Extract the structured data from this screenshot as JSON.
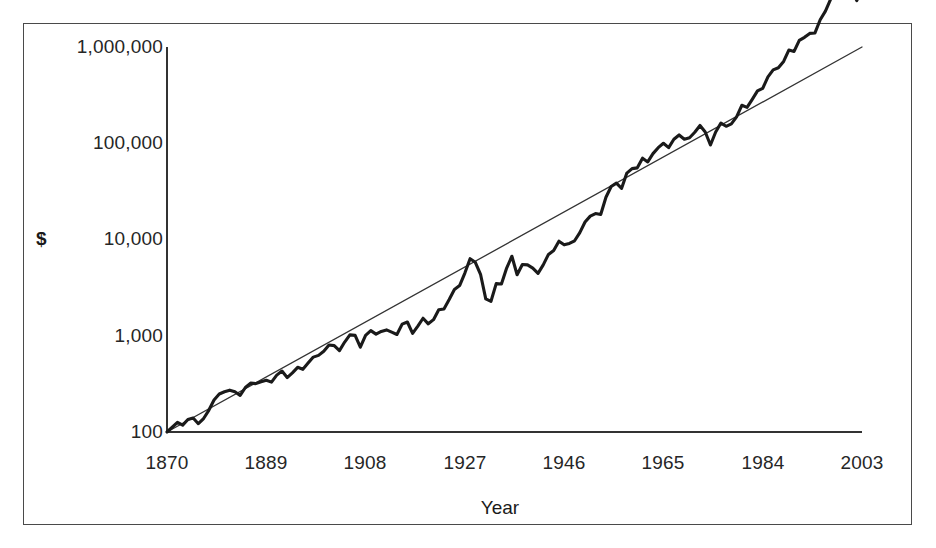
{
  "figure": {
    "background": "#ffffff",
    "frame_color": "#4a4a4a",
    "series_color": "#1a1a1a",
    "trend_color": "#333333"
  },
  "axis": {
    "y_label": "$",
    "x_label": "Year",
    "y_ticks": [
      "1,000,000",
      "100,000",
      "10,000",
      "1,000",
      "100"
    ],
    "x_ticks": [
      "1870",
      "1889",
      "1908",
      "1927",
      "1946",
      "1965",
      "1984",
      "2003"
    ]
  },
  "chart_data": {
    "type": "line",
    "title": "",
    "xlabel": "Year",
    "ylabel": "$",
    "yscale": "log",
    "ylim": [
      100,
      1000000
    ],
    "xlim": [
      1870,
      2003
    ],
    "grid": false,
    "legend": null,
    "ytick_values": [
      1000000,
      100000,
      10000,
      1000,
      100
    ],
    "ytick_labels": [
      "1,000,000",
      "100,000",
      "10,000",
      "1,000",
      "100"
    ],
    "xtick_values": [
      1870,
      1889,
      1908,
      1927,
      1946,
      1965,
      1984,
      2003
    ],
    "xtick_labels": [
      "1870",
      "1889",
      "1908",
      "1927",
      "1946",
      "1965",
      "1984",
      "2003"
    ],
    "series": [
      {
        "name": "Cumulative value",
        "style": "thick-line",
        "x": [
          1870,
          1871,
          1872,
          1873,
          1874,
          1875,
          1876,
          1877,
          1878,
          1879,
          1880,
          1881,
          1882,
          1883,
          1884,
          1885,
          1886,
          1887,
          1888,
          1889,
          1890,
          1891,
          1892,
          1893,
          1894,
          1895,
          1896,
          1897,
          1898,
          1899,
          1900,
          1901,
          1902,
          1903,
          1904,
          1905,
          1906,
          1907,
          1908,
          1909,
          1910,
          1911,
          1912,
          1913,
          1914,
          1915,
          1916,
          1917,
          1918,
          1919,
          1920,
          1921,
          1922,
          1923,
          1924,
          1925,
          1926,
          1927,
          1928,
          1929,
          1930,
          1931,
          1932,
          1933,
          1934,
          1935,
          1936,
          1937,
          1938,
          1939,
          1940,
          1941,
          1942,
          1943,
          1944,
          1945,
          1946,
          1947,
          1948,
          1949,
          1950,
          1951,
          1952,
          1953,
          1954,
          1955,
          1956,
          1957,
          1958,
          1959,
          1960,
          1961,
          1962,
          1963,
          1964,
          1965,
          1966,
          1967,
          1968,
          1969,
          1970,
          1971,
          1972,
          1973,
          1974,
          1975,
          1976,
          1977,
          1978,
          1979,
          1980,
          1981,
          1982,
          1983,
          1984,
          1985,
          1986,
          1987,
          1988,
          1989,
          1990,
          1991,
          1992,
          1993,
          1994,
          1995,
          1996,
          1997,
          1998,
          1999,
          2000,
          2001,
          2002,
          2003
        ],
        "y": [
          100,
          112,
          126,
          118,
          135,
          140,
          122,
          138,
          168,
          215,
          248,
          262,
          272,
          262,
          240,
          290,
          322,
          318,
          332,
          345,
          330,
          390,
          430,
          368,
          412,
          470,
          448,
          520,
          600,
          625,
          690,
          800,
          790,
          700,
          860,
          1020,
          1010,
          760,
          1010,
          1130,
          1040,
          1110,
          1150,
          1090,
          1030,
          1320,
          1390,
          1060,
          1260,
          1520,
          1330,
          1470,
          1860,
          1900,
          2380,
          3020,
          3320,
          4480,
          6320,
          5800,
          4350,
          2420,
          2280,
          3480,
          3450,
          5050,
          6700,
          4300,
          5500,
          5450,
          5050,
          4450,
          5450,
          7000,
          7700,
          9600,
          8800,
          9100,
          9700,
          11800,
          15200,
          17500,
          18600,
          18200,
          27500,
          35500,
          38500,
          34000,
          49000,
          54500,
          55500,
          70000,
          64000,
          78000,
          90000,
          100000,
          90000,
          110000,
          122000,
          110000,
          114000,
          130000,
          153000,
          131000,
          96000,
          131000,
          162000,
          150000,
          159000,
          188000,
          248000,
          236000,
          286000,
          350000,
          372000,
          489000,
          578000,
          608000,
          708000,
          930000,
          900000,
          1170000,
          1260000,
          1385000,
          1400000,
          1920000,
          2360000,
          3140000,
          4030000,
          4870000,
          4430000,
          3900000,
          3040000,
          3900000
        ],
        "y_display_note": "plotted on log scale starting at 100 in 1870"
      },
      {
        "name": "Exponential trend",
        "style": "thin-line",
        "x": [
          1870,
          2003
        ],
        "y": [
          100,
          1000000
        ],
        "y_display_note": "straight line on log axis from 100 at 1870 to ~900,000 near 2003"
      }
    ]
  }
}
